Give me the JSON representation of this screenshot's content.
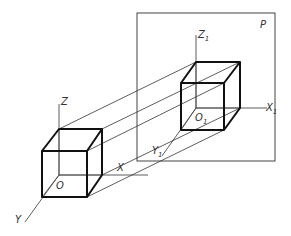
{
  "diagram": {
    "type": "oblique-projection",
    "plane_label": "P",
    "object_axes": {
      "x": "X",
      "y": "Y",
      "z": "Z",
      "origin": "O"
    },
    "projected_axes": {
      "x": "X",
      "x_sub": "1",
      "y": "Y",
      "y_sub": "1",
      "z": "Z",
      "z_sub": "1",
      "origin": "O",
      "origin_sub": "1"
    },
    "colors": {
      "line": "#333333",
      "thick": "#111111",
      "background": "#ffffff"
    }
  }
}
